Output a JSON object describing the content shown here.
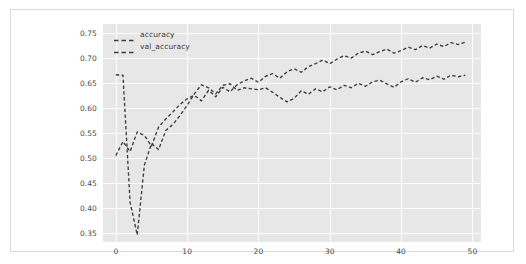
{
  "chart_data": {
    "type": "line",
    "title": "",
    "xlabel": "",
    "ylabel": "",
    "xlim": [
      -1.8,
      51.2
    ],
    "ylim": [
      0.333,
      0.767
    ],
    "grid": true,
    "legend_position": "upper left",
    "background_color": "#e7e7e7",
    "gridline_color": "#fdfdfd",
    "line_style": "dashed",
    "xticks": [
      0,
      10,
      20,
      30,
      40,
      50
    ],
    "xtick_labels": [
      "0",
      "10",
      "20",
      "30",
      "40",
      "50"
    ],
    "yticks": [
      0.35,
      0.4,
      0.45,
      0.5,
      0.55,
      0.6,
      0.65,
      0.7,
      0.75
    ],
    "ytick_labels": [
      "0.35",
      "0.40",
      "0.45",
      "0.50",
      "0.55",
      "0.60",
      "0.65",
      "0.70",
      "0.75"
    ],
    "x": [
      0,
      1,
      2,
      3,
      4,
      5,
      6,
      7,
      8,
      9,
      10,
      11,
      12,
      13,
      14,
      15,
      16,
      17,
      18,
      19,
      20,
      21,
      22,
      23,
      24,
      25,
      26,
      27,
      28,
      29,
      30,
      31,
      32,
      33,
      34,
      35,
      36,
      37,
      38,
      39,
      40,
      41,
      42,
      43,
      44,
      45,
      46,
      47,
      48,
      49
    ],
    "series": [
      {
        "name": "accuracy",
        "color": "#3c3c3c",
        "values": [
          0.505,
          0.533,
          0.513,
          0.552,
          0.545,
          0.524,
          0.562,
          0.578,
          0.592,
          0.607,
          0.618,
          0.625,
          0.614,
          0.635,
          0.622,
          0.641,
          0.632,
          0.646,
          0.654,
          0.659,
          0.651,
          0.663,
          0.668,
          0.659,
          0.672,
          0.678,
          0.671,
          0.682,
          0.688,
          0.695,
          0.688,
          0.697,
          0.704,
          0.699,
          0.709,
          0.713,
          0.706,
          0.712,
          0.717,
          0.709,
          0.714,
          0.721,
          0.716,
          0.724,
          0.719,
          0.727,
          0.722,
          0.73,
          0.726,
          0.731
        ]
      },
      {
        "name": "val_accuracy",
        "color": "#3c3c3c",
        "values": [
          0.666,
          0.665,
          0.412,
          0.347,
          0.486,
          0.529,
          0.517,
          0.555,
          0.567,
          0.585,
          0.605,
          0.628,
          0.646,
          0.64,
          0.628,
          0.645,
          0.648,
          0.635,
          0.64,
          0.638,
          0.636,
          0.64,
          0.631,
          0.621,
          0.612,
          0.619,
          0.634,
          0.627,
          0.638,
          0.632,
          0.642,
          0.636,
          0.645,
          0.64,
          0.649,
          0.643,
          0.652,
          0.655,
          0.648,
          0.641,
          0.652,
          0.658,
          0.651,
          0.66,
          0.656,
          0.663,
          0.657,
          0.665,
          0.662,
          0.665
        ]
      }
    ]
  },
  "legend": {
    "entries": [
      {
        "label": "accuracy"
      },
      {
        "label": "val_accuracy"
      }
    ]
  }
}
